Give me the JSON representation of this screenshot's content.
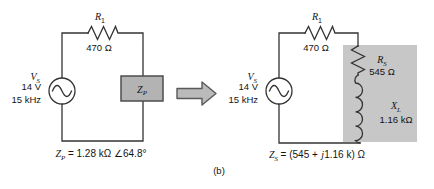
{
  "caption": "(b)",
  "icons": {
    "transform_arrow": "right-block-arrow",
    "ac_source": "sine-wave-in-circle"
  },
  "colors": {
    "background": "#ffffff",
    "wire": "#333333",
    "text": "#141414",
    "impedance_box_fill": "#b3b3b3",
    "impedance_box_border": "#4d4d4d",
    "shaded_region_fill": "#c7c7c7",
    "arrow_fill": "#bababa",
    "arrow_border": "#595959"
  },
  "left_circuit": {
    "r1_label": "R",
    "r1_sub": "1",
    "r1_value": "470 Ω",
    "source_label": "V",
    "source_sub": "S",
    "source_voltage": "14 V",
    "source_frequency": "15 kHz",
    "box_label": "Z",
    "box_sub": "P",
    "eq_symbol": "Z",
    "eq_sub": "P",
    "eq_value": "= 1.28 kΩ ∠64.8°"
  },
  "right_circuit": {
    "r1_label": "R",
    "r1_sub": "1",
    "r1_value": "470 Ω",
    "source_label": "V",
    "source_sub": "S",
    "source_voltage": "14 V",
    "source_frequency": "15 kHz",
    "rs_label": "R",
    "rs_sub": "S",
    "rs_value": "545 Ω",
    "xl_label": "X",
    "xl_sub": "L",
    "xl_value": "1.16 kΩ",
    "eq_symbol": "Z",
    "eq_sub": "S",
    "eq_pre": "= (545 +",
    "eq_j": "j",
    "eq_post": "1.16 k) Ω"
  }
}
